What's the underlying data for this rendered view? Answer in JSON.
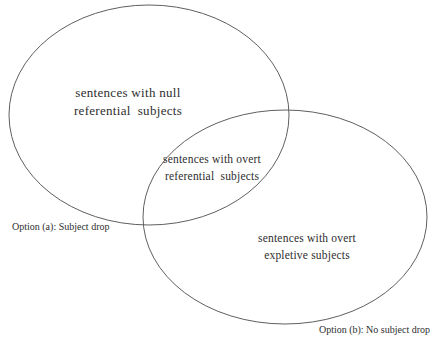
{
  "figure": {
    "type": "venn-diagram",
    "background_color": "#ffffff",
    "stroke_color": "#5f5f5f",
    "text_color": "#2e2e2e",
    "left_set": {
      "label_line1": "sentences with null",
      "label_line2": "referential  subjects",
      "caption": "Option (a): Subject drop"
    },
    "right_set": {
      "label_line1": "sentences with overt",
      "label_line2": "expletive subjects",
      "caption": "Option (b): No subject drop"
    },
    "intersection": {
      "label_line1": "sentences with overt",
      "label_line2": "referential  subjects"
    }
  }
}
